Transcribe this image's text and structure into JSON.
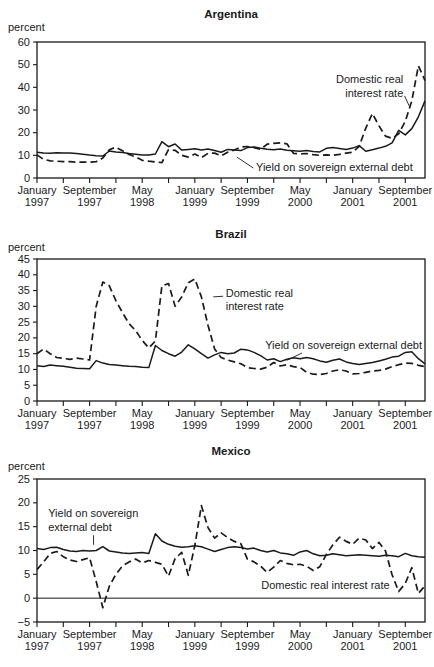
{
  "figure": {
    "background": "#ffffff",
    "ink_color": "#1a1a1a"
  },
  "chart_data": [
    {
      "type": "line",
      "id": "argentina",
      "title": "Argentina",
      "y_axis_label": "percent",
      "y_min": 0,
      "y_max": 60,
      "y_step": 10,
      "x_start": "January 1997",
      "x_end": "December 2001",
      "frequency": "monthly",
      "x_tick_labels": [
        [
          "January",
          "1997"
        ],
        [
          "September",
          "1997"
        ],
        [
          "May",
          "1998"
        ],
        [
          "January",
          "1999"
        ],
        [
          "September",
          "1999"
        ],
        [
          "May",
          "2000"
        ],
        [
          "January",
          "2001"
        ],
        [
          "September",
          "2001"
        ]
      ],
      "zero_line": false,
      "series": [
        {
          "name": "Domestic real interest rate",
          "style": "dashed",
          "values": [
            10.2,
            8.2,
            7.6,
            7.4,
            7.2,
            7.2,
            7.0,
            7.0,
            7.0,
            7.2,
            8.8,
            12.5,
            13.6,
            12.0,
            10.4,
            9.3,
            7.8,
            7.4,
            7.1,
            6.8,
            12.5,
            12.2,
            10.0,
            9.2,
            10.6,
            9.0,
            10.9,
            11.0,
            9.8,
            11.4,
            12.3,
            13.7,
            13.9,
            13.4,
            12.6,
            14.9,
            15.3,
            15.5,
            15.1,
            10.9,
            10.6,
            10.8,
            10.3,
            10.0,
            10.2,
            10.0,
            10.4,
            11.0,
            11.4,
            14.0,
            22.0,
            28.5,
            23.0,
            18.5,
            17.5,
            19.5,
            25.0,
            34.0,
            49.5,
            43.0
          ]
        },
        {
          "name": "Yield on sovereign external debt",
          "style": "solid",
          "values": [
            11.4,
            11.0,
            10.9,
            11.1,
            11.0,
            11.0,
            10.8,
            10.5,
            10.1,
            9.8,
            9.7,
            11.9,
            11.5,
            11.2,
            10.8,
            10.5,
            10.2,
            10.1,
            10.6,
            16.0,
            13.8,
            15.0,
            12.3,
            12.6,
            12.9,
            12.4,
            12.8,
            12.1,
            11.4,
            12.6,
            12.3,
            12.1,
            13.4,
            13.7,
            13.1,
            12.7,
            12.5,
            12.8,
            12.2,
            12.0,
            11.8,
            12.1,
            11.7,
            11.5,
            13.1,
            13.4,
            13.0,
            12.6,
            13.2,
            14.3,
            11.8,
            12.5,
            13.2,
            14.0,
            15.5,
            21.0,
            19.0,
            21.8,
            27.0,
            34.0
          ]
        }
      ],
      "annotations": [
        {
          "lines": [
            "Domestic real",
            "interest rate"
          ],
          "month": 55.7,
          "value": 41.9,
          "align": "end",
          "leader": {
            "m1": 55.9,
            "v1": 36.2,
            "m2": 56.6,
            "v2": 31.8
          }
        },
        {
          "lines": [
            "Yield on sovereign external debt"
          ],
          "month": 33.3,
          "value": 3.1,
          "align": "start",
          "leader": {
            "m1": 32.9,
            "v1": 4.4,
            "m2": 30.4,
            "v2": 9.2
          }
        }
      ]
    },
    {
      "type": "line",
      "id": "brazil",
      "title": "Brazil",
      "y_axis_label": "percent",
      "y_min": 0,
      "y_max": 45,
      "y_step": 5,
      "x_start": "January 1997",
      "x_end": "December 2001",
      "frequency": "monthly",
      "x_tick_labels": [
        [
          "January",
          "1997"
        ],
        [
          "September",
          "1997"
        ],
        [
          "May",
          "1998"
        ],
        [
          "January",
          "1999"
        ],
        [
          "September",
          "1999"
        ],
        [
          "May",
          "2000"
        ],
        [
          "January",
          "2001"
        ],
        [
          "September",
          "2001"
        ]
      ],
      "zero_line": false,
      "series": [
        {
          "name": "Domestic real interest rate",
          "style": "dashed",
          "values": [
            15.0,
            16.5,
            15.0,
            13.8,
            13.5,
            13.2,
            13.6,
            13.3,
            13.0,
            30.0,
            37.7,
            36.5,
            31.8,
            28.0,
            24.5,
            22.3,
            19.2,
            16.8,
            19.0,
            36.5,
            37.2,
            30.0,
            33.0,
            37.5,
            38.7,
            33.0,
            24.0,
            16.5,
            13.8,
            13.0,
            12.4,
            11.8,
            10.6,
            10.3,
            10.1,
            10.7,
            12.2,
            11.1,
            11.5,
            10.9,
            10.6,
            9.1,
            8.5,
            8.4,
            8.7,
            9.5,
            9.9,
            9.5,
            8.6,
            8.7,
            9.1,
            9.5,
            9.7,
            10.1,
            10.9,
            11.5,
            12.0,
            11.9,
            11.3,
            10.9
          ]
        },
        {
          "name": "Yield on sovereign external debt",
          "style": "solid",
          "values": [
            11.2,
            10.9,
            11.4,
            11.2,
            11.0,
            10.7,
            10.4,
            10.3,
            10.2,
            12.8,
            12.0,
            11.6,
            11.4,
            11.2,
            11.0,
            10.9,
            10.7,
            10.6,
            17.6,
            16.0,
            15.0,
            14.2,
            15.5,
            17.8,
            16.5,
            15.0,
            13.6,
            14.6,
            15.4,
            15.0,
            15.2,
            16.4,
            16.2,
            15.4,
            14.4,
            13.0,
            13.4,
            12.5,
            13.2,
            13.7,
            13.4,
            13.8,
            13.4,
            12.7,
            12.3,
            12.9,
            13.3,
            12.4,
            11.9,
            11.6,
            11.9,
            12.2,
            12.7,
            13.2,
            13.9,
            14.2,
            15.4,
            15.6,
            13.4,
            11.8
          ]
        }
      ],
      "annotations": [
        {
          "lines": [
            "Domestic real",
            "interest rate"
          ],
          "month": 28.7,
          "value": 33.0,
          "align": "start",
          "leader": {
            "m1": 28.3,
            "v1": 33.2,
            "m2": 26.8,
            "v2": 33.0
          }
        },
        {
          "lines": [
            "Yield on sovereign external debt"
          ],
          "month": 34.7,
          "value": 16.6,
          "align": "start",
          "leader": {
            "m1": 40.3,
            "v1": 15.2,
            "m2": 38.0,
            "v2": 12.9
          }
        }
      ]
    },
    {
      "type": "line",
      "id": "mexico",
      "title": "Mexico",
      "y_axis_label": "percent",
      "y_min": -5,
      "y_max": 25,
      "y_step": 5,
      "x_start": "January 1997",
      "x_end": "December 2001",
      "frequency": "monthly",
      "x_tick_labels": [
        [
          "January",
          "1997"
        ],
        [
          "September",
          "1997"
        ],
        [
          "May",
          "1998"
        ],
        [
          "January",
          "1999"
        ],
        [
          "September",
          "1999"
        ],
        [
          "May",
          "2000"
        ],
        [
          "January",
          "2001"
        ],
        [
          "September",
          "2001"
        ]
      ],
      "zero_line": true,
      "series": [
        {
          "name": "Domestic real interest rate",
          "style": "dashed",
          "values": [
            6.0,
            7.6,
            9.4,
            9.8,
            8.7,
            8.0,
            7.7,
            8.1,
            8.5,
            3.5,
            -2.0,
            2.5,
            5.0,
            6.8,
            7.6,
            8.2,
            7.4,
            7.9,
            7.5,
            7.1,
            4.6,
            8.3,
            9.6,
            4.8,
            11.0,
            19.4,
            14.8,
            12.6,
            13.7,
            12.7,
            11.9,
            11.4,
            8.2,
            7.6,
            6.7,
            5.4,
            6.5,
            7.9,
            7.3,
            7.0,
            7.1,
            6.7,
            5.8,
            6.6,
            9.2,
            11.2,
            12.8,
            11.9,
            11.3,
            12.6,
            12.2,
            10.4,
            11.7,
            9.9,
            4.9,
            1.4,
            3.1,
            6.4,
            1.0,
            2.6
          ]
        },
        {
          "name": "Yield on sovereign external debt",
          "style": "solid",
          "values": [
            10.4,
            10.2,
            10.6,
            10.7,
            10.2,
            9.9,
            9.8,
            10.0,
            9.9,
            10.0,
            10.8,
            9.9,
            9.7,
            9.5,
            9.4,
            9.5,
            9.6,
            9.4,
            13.5,
            12.0,
            11.3,
            10.9,
            10.7,
            10.8,
            11.0,
            10.8,
            10.3,
            9.8,
            10.2,
            10.6,
            10.8,
            10.6,
            10.3,
            10.5,
            10.0,
            9.7,
            10.0,
            9.5,
            9.3,
            9.0,
            9.7,
            10.0,
            9.3,
            8.9,
            9.0,
            9.3,
            9.1,
            8.9,
            9.0,
            9.1,
            9.0,
            8.9,
            8.8,
            9.0,
            8.9,
            8.7,
            9.4,
            8.9,
            8.7,
            8.6
          ]
        }
      ],
      "annotations": [
        {
          "lines": [
            "Yield on sovereign",
            "external debt"
          ],
          "month": 1.7,
          "value": 17.0,
          "align": "start",
          "leader": {
            "m1": 8.6,
            "v1": 13.2,
            "m2": 8.6,
            "v2": 11.2
          }
        },
        {
          "lines": [
            "Domestic real interest rate"
          ],
          "month": 34.1,
          "value": 1.9,
          "align": "start",
          "leader": null
        }
      ]
    }
  ]
}
